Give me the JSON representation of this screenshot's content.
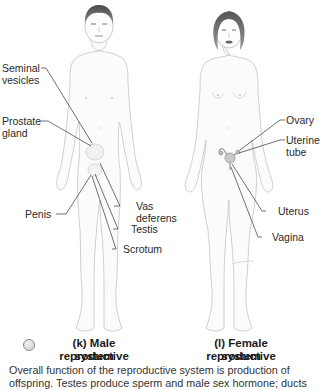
{
  "figures": [
    {
      "id": "k",
      "caption_line1": "(k) Male reproductive",
      "caption_line2": "system",
      "labels": {
        "seminal_vesicles_1": "Seminal",
        "seminal_vesicles_2": "vesicles",
        "prostate_gland_1": "Prostate",
        "prostate_gland_2": "gland",
        "penis": "Penis",
        "vas_deferens_1": "Vas",
        "vas_deferens_2": "deferens",
        "testis": "Testis",
        "scrotum": "Scrotum"
      }
    },
    {
      "id": "l",
      "caption_line1": "(l) Female reproductive",
      "caption_line2": "system",
      "labels": {
        "ovary": "Ovary",
        "uterine_tube_1": "Uterine",
        "uterine_tube_2": "tube",
        "uterus": "Uterus",
        "vagina": "Vagina"
      }
    }
  ],
  "description": "Overall function of the reproductive system is production of offspring. Testes produce sperm and male sex hormone; ducts"
}
